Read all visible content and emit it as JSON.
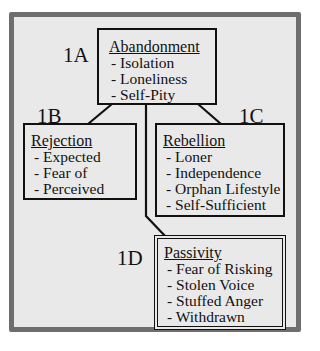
{
  "diagram": {
    "nodes": [
      {
        "id": "1A",
        "label": "1A",
        "title": "Abandonment",
        "items": [
          "- Isolation",
          "- Loneliness",
          "- Self-Pity"
        ]
      },
      {
        "id": "1B",
        "label": "1B",
        "title": "Rejection",
        "items": [
          "- Expected",
          "- Fear of",
          "- Perceived"
        ]
      },
      {
        "id": "1C",
        "label": "1C",
        "title": "Rebellion",
        "items": [
          "- Loner",
          "- Independence",
          "- Orphan Lifestyle",
          "- Self-Sufficient"
        ]
      },
      {
        "id": "1D",
        "label": "1D",
        "title": "Passivity",
        "items": [
          "- Fear of Risking",
          "- Stolen Voice",
          "- Stuffed Anger",
          "- Withdrawn"
        ]
      }
    ],
    "edges": [
      {
        "from": "1A",
        "to": "1B"
      },
      {
        "from": "1A",
        "to": "1C"
      },
      {
        "from": "1A",
        "to": "1D"
      }
    ]
  }
}
